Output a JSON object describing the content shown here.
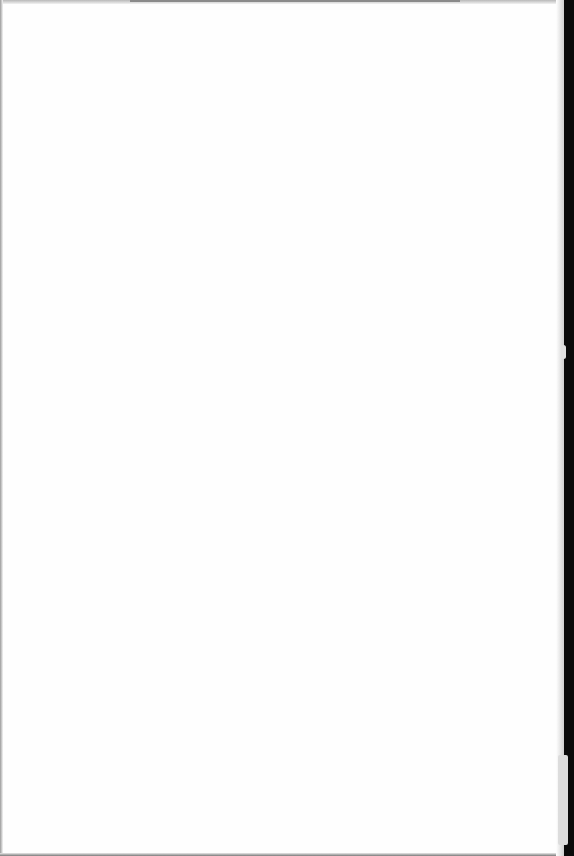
{
  "document": {
    "type": "blank scanned page",
    "text_blocks": [],
    "colors": {
      "paper": "#fefefe",
      "binding_edge": "#0a0a0a",
      "edge_shadow": "#9a9a9a"
    }
  }
}
